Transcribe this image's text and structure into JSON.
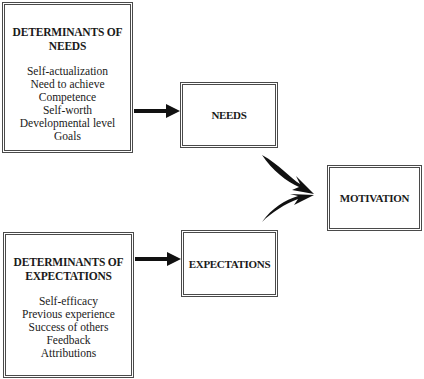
{
  "diagram": {
    "determinants_needs": {
      "title_line1": "DETERMINANTS OF",
      "title_line2": "NEEDS",
      "items": [
        "Self-actualization",
        "Need to achieve",
        "Competence",
        "Self-worth",
        "Developmental level",
        "Goals"
      ]
    },
    "determinants_expectations": {
      "title_line1": "DETERMINANTS OF",
      "title_line2": "EXPECTATIONS",
      "items": [
        "Self-efficacy",
        "Previous experience",
        "Success of others",
        "Feedback",
        "Attributions"
      ]
    },
    "needs": {
      "label": "NEEDS"
    },
    "expectations": {
      "label": "EXPECTATIONS"
    },
    "motivation": {
      "label": "MOTIVATION"
    },
    "edges": [
      {
        "from": "determinants_needs",
        "to": "needs"
      },
      {
        "from": "determinants_expectations",
        "to": "expectations"
      },
      {
        "from": "needs",
        "to": "motivation"
      },
      {
        "from": "expectations",
        "to": "motivation"
      }
    ]
  }
}
